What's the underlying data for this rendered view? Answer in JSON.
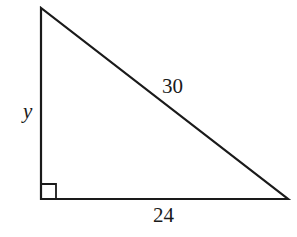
{
  "diagram": {
    "type": "right-triangle",
    "vertices": {
      "top": [
        41,
        8
      ],
      "right_angle": [
        41,
        199
      ],
      "bottom_right": [
        288,
        199
      ]
    },
    "right_angle_marker": true,
    "sides": {
      "vertical_leg": {
        "label": "y"
      },
      "hypotenuse": {
        "label": "30"
      },
      "horizontal_leg": {
        "label": "24"
      }
    },
    "colors": {
      "stroke": "#1a1a1a",
      "background": "#ffffff"
    }
  }
}
